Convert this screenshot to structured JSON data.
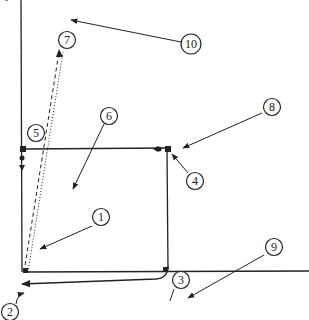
{
  "diagram": {
    "type": "patent-style line drawing with numbered callouts",
    "colors": {
      "stroke": "#222222",
      "background": "#ffffff"
    },
    "callouts": [
      {
        "id": "c1",
        "label": "1"
      },
      {
        "id": "c2",
        "label": "2"
      },
      {
        "id": "c3",
        "label": "3"
      },
      {
        "id": "c4",
        "label": "4"
      },
      {
        "id": "c5",
        "label": "5"
      },
      {
        "id": "c6",
        "label": "6"
      },
      {
        "id": "c7",
        "label": "7"
      },
      {
        "id": "c8",
        "label": "8"
      },
      {
        "id": "c9",
        "label": "9"
      },
      {
        "id": "c10",
        "label": "10"
      }
    ]
  }
}
